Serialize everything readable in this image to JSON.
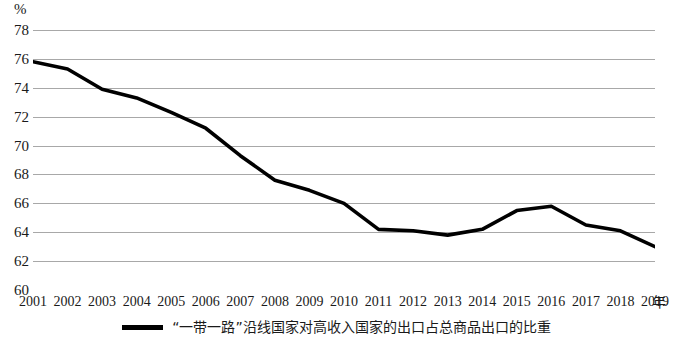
{
  "chart_data": {
    "type": "line",
    "title": "",
    "subtitle": "",
    "xlabel": "年",
    "ylabel": "%",
    "ylim": [
      60,
      78
    ],
    "ytick_step": 2,
    "yticks": [
      "78",
      "76",
      "74",
      "72",
      "70",
      "68",
      "66",
      "64",
      "62",
      "60"
    ],
    "grid": "horizontal",
    "legend_position": "bottom-center",
    "categories": [
      "2001",
      "2002",
      "2003",
      "2004",
      "2005",
      "2006",
      "2007",
      "2008",
      "2009",
      "2010",
      "2011",
      "2012",
      "2013",
      "2014",
      "2015",
      "2016",
      "2017",
      "2018",
      "2019"
    ],
    "series": [
      {
        "name": "“一带一路”沿线国家对高收入国家的出口占总商品出口的比重",
        "color": "#000000",
        "values": [
          75.8,
          75.3,
          73.9,
          73.3,
          72.3,
          71.2,
          69.3,
          67.6,
          66.9,
          66.0,
          64.2,
          64.1,
          63.8,
          64.2,
          65.5,
          65.8,
          64.5,
          64.1,
          63.0
        ]
      }
    ],
    "annotations": []
  },
  "axes": {
    "y_unit_label": "%",
    "x_unit_label": "年"
  },
  "legend": {
    "entries": [
      {
        "label": "“一带一路”沿线国家对高收入国家的出口占总商品出口的比重",
        "marker": "line-marker"
      }
    ]
  },
  "colors": {
    "series_line": "#000000",
    "gridline": "#a8a8a8",
    "background": "#ffffff",
    "text": "#1a1a1a"
  }
}
